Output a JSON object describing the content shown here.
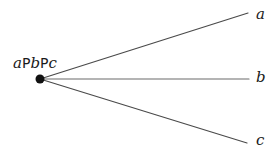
{
  "figure": {
    "background_color": "#ffffff",
    "width": 275,
    "height": 160
  },
  "vertex": {
    "name": "vertex-point",
    "label_parts": [
      {
        "text": "a",
        "style": "italic"
      },
      {
        "text": "P",
        "style": "upright"
      },
      {
        "text": "b",
        "style": "italic"
      },
      {
        "text": "P",
        "style": "upright"
      },
      {
        "text": "c",
        "style": "italic"
      }
    ],
    "label_plain": "aPbPc",
    "x": 40,
    "y": 79,
    "dot_radius": 4.5,
    "dot_color": "#111111"
  },
  "rays": [
    {
      "name": "ray-a",
      "label": "a",
      "x1": 40,
      "y1": 79,
      "x2": 248,
      "y2": 13,
      "stroke": "#4a4a4a",
      "stroke_width": 1.2
    },
    {
      "name": "ray-b",
      "label": "b",
      "x1": 40,
      "y1": 79,
      "x2": 249,
      "y2": 79,
      "stroke": "#6b6b6b",
      "stroke_width": 1.2
    },
    {
      "name": "ray-c",
      "label": "c",
      "x1": 40,
      "y1": 79,
      "x2": 247,
      "y2": 143,
      "stroke": "#4a4a4a",
      "stroke_width": 1.2
    }
  ],
  "endpoint_labels": {
    "a": "a",
    "b": "b",
    "c": "c"
  },
  "chart_data": {
    "type": "diagram",
    "title": "",
    "vertex_label": "aPbPc",
    "ray_labels": [
      "a",
      "b",
      "c"
    ],
    "ray_endpoints": [
      {
        "label": "a",
        "x": 248,
        "y": 13
      },
      {
        "label": "b",
        "x": 249,
        "y": 79
      },
      {
        "label": "c",
        "x": 247,
        "y": 143
      }
    ],
    "origin": {
      "x": 40,
      "y": 79
    }
  }
}
